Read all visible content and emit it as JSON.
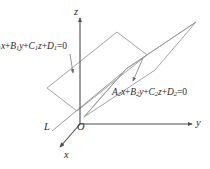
{
  "figure": {
    "kind": "3d-geometry-diagram",
    "background_color": "#ffffff",
    "stroke_color": "#8a8a8a",
    "axis_color": "#5a5a5a",
    "text_color": "#2b2b2b"
  },
  "axes": {
    "z": {
      "label": "z"
    },
    "y": {
      "label": "y"
    },
    "x": {
      "label": "x"
    },
    "origin": {
      "label": "O"
    }
  },
  "intersection_line": {
    "label": "L"
  },
  "planes": [
    {
      "id": "plane-1",
      "equation": {
        "coef_a": "A",
        "coef_a_sub": "1",
        "var_x": "x",
        "plus_1": "+",
        "coef_b": "B",
        "coef_b_sub": "1",
        "var_y": "y",
        "plus_2": "+",
        "coef_c": "C",
        "coef_c_sub": "1",
        "var_z": "z",
        "plus_3": "+",
        "coef_d": "D",
        "coef_d_sub": "1",
        "equals": "=0"
      },
      "equation_text": "A1x+B1y+C1z+D1=0",
      "note": "label is clipped at the left image edge; leading A1 is partly cut off"
    },
    {
      "id": "plane-2",
      "equation": {
        "coef_a": "A",
        "coef_a_sub": "2",
        "var_x": "x",
        "plus_1": "+",
        "coef_b": "B",
        "coef_b_sub": "2",
        "var_y": "y",
        "plus_2": "+",
        "coef_c": "C",
        "coef_c_sub": "2",
        "var_z": "z",
        "plus_3": "+",
        "coef_d": "D",
        "coef_d_sub": "2",
        "equals": "=0"
      },
      "equation_text": "A2x+B2y+C2z+D2=0"
    }
  ]
}
